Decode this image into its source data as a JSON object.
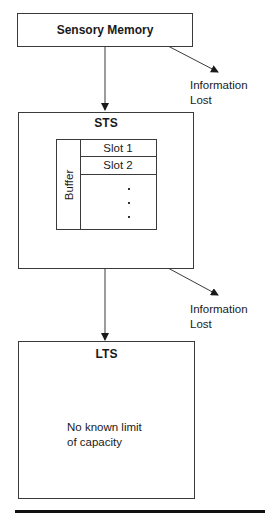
{
  "diagram": {
    "sensory": {
      "label": "Sensory Memory"
    },
    "sts": {
      "label": "STS",
      "buffer": {
        "label": "Buffer",
        "slots": [
          "Slot 1",
          "Slot 2"
        ],
        "ellipsis": [
          ".",
          ".",
          "."
        ]
      }
    },
    "lts": {
      "label": "LTS",
      "note_line1": "No known limit",
      "note_line2": "of capacity"
    },
    "loss_labels": [
      {
        "line1": "Information",
        "line2": "Lost"
      },
      {
        "line1": "Information",
        "line2": "Lost"
      }
    ],
    "colors": {
      "line": "#3a3a3a",
      "rule": "#111111",
      "background": "#ffffff"
    }
  }
}
